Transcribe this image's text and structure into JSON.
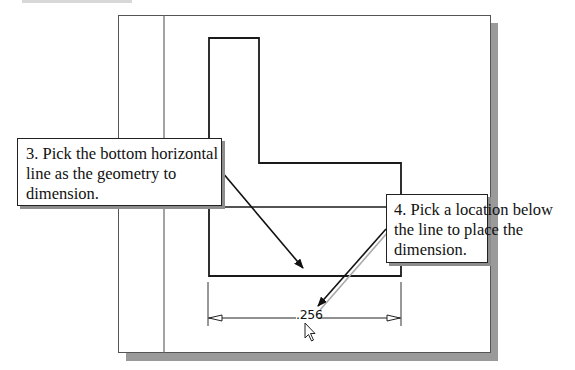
{
  "figure": {
    "type": "CAD sketch tutorial illustration",
    "colors": {
      "frame_border": "#555555",
      "frame_shadow": "#9a9a9a",
      "geometry": "#1a1a1a",
      "callout_border": "#222222",
      "callout_shadow": "#8d8d8d"
    }
  },
  "callouts": [
    {
      "step": "3",
      "lines": [
        "3. Pick the bottom horizontal",
        "line as the geometry to",
        "dimension."
      ]
    },
    {
      "step": "4",
      "lines": [
        "4. Pick a location below",
        "the line to place the",
        "dimension."
      ]
    }
  ],
  "dimension": {
    "value": ".256"
  },
  "cursor": {
    "icon": "arrow-cursor-icon"
  }
}
